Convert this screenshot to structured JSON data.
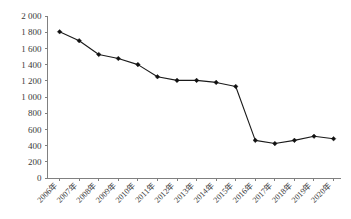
{
  "chart_data": {
    "type": "line",
    "title": "",
    "subtitle": "",
    "xlabel": "",
    "ylabel": "",
    "grid": false,
    "legend": "none",
    "categories": [
      "2006年",
      "2007年",
      "2008年",
      "2009年",
      "2010年",
      "2011年",
      "2012年",
      "2013年",
      "2014年",
      "2015年",
      "2016年",
      "2017年",
      "2018年",
      "2019年",
      "2020年"
    ],
    "values": [
      1805,
      1695,
      1525,
      1475,
      1400,
      1250,
      1205,
      1205,
      1180,
      1130,
      465,
      425,
      465,
      515,
      485
    ],
    "series": [
      {
        "name": "",
        "values": [
          1805,
          1695,
          1525,
          1475,
          1400,
          1250,
          1205,
          1205,
          1180,
          1130,
          465,
          425,
          465,
          515,
          485
        ]
      }
    ],
    "ylim": [
      0,
      2000
    ],
    "yticks": [
      0,
      200,
      400,
      600,
      800,
      1000,
      1200,
      1400,
      1600,
      1800,
      2000
    ],
    "ytick_labels": [
      "0",
      "200",
      "400",
      "600",
      "800",
      "1 000",
      "1 200",
      "1 400",
      "1 600",
      "1 800",
      "2 000"
    ],
    "xtick_labels": [
      "2006年",
      "2007年",
      "2008年",
      "2009年",
      "2010年",
      "2011年",
      "2012年",
      "2013年",
      "2014年",
      "2015年",
      "2016年",
      "2017年",
      "2018年",
      "2019年",
      "2020年"
    ],
    "marker": "diamond",
    "line_color": "#1a1a1a",
    "marker_color": "#111111",
    "axis_color": "#808080",
    "background_color": "#ffffff"
  }
}
